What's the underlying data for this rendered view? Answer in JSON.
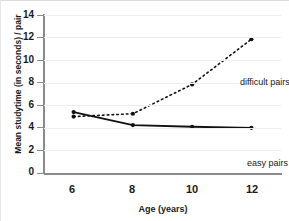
{
  "chart_data": {
    "type": "line",
    "title": "",
    "subtitle": "",
    "xlabel": "Age (years)",
    "ylabel": "Mean studytime (in seconds) / pair",
    "x": [
      6,
      8,
      10,
      12
    ],
    "xtick_labels": [
      "6",
      "8",
      "10",
      "12"
    ],
    "ytick_labels": [
      "0",
      "2",
      "4",
      "6",
      "8",
      "10",
      "12",
      "14"
    ],
    "yticks": [
      0,
      2,
      4,
      6,
      8,
      10,
      12,
      14
    ],
    "xlim": [
      5,
      13
    ],
    "ylim": [
      0,
      14
    ],
    "grid": "horizontal",
    "legend_position": "inline-annotation",
    "series": [
      {
        "name": "difficult pairs",
        "values": [
          5.0,
          5.25,
          7.85,
          11.85
        ],
        "linestyle": "dotted",
        "marker": "circle",
        "color": "#111111"
      },
      {
        "name": "easy pairs",
        "values": [
          5.4,
          4.25,
          4.1,
          4.0
        ],
        "linestyle": "solid",
        "marker": "circle",
        "color": "#111111"
      }
    ],
    "annotations": [
      {
        "text": "difficult pairs",
        "series": "difficult pairs"
      },
      {
        "text": "easy pairs",
        "series": "easy pairs"
      }
    ]
  },
  "axes": {
    "y_title": "Mean studytime (in seconds) / pair",
    "x_title": "Age (years)",
    "y_labels": [
      "14",
      "12",
      "10",
      "8",
      "6",
      "4",
      "2",
      "0"
    ],
    "x_labels": [
      "6",
      "8",
      "10",
      "12"
    ]
  },
  "labels": {
    "difficult": "difficult pairs",
    "easy": "easy pairs"
  },
  "colors": {
    "line": "#111111",
    "axis": "#8a8a8a",
    "grid": "#eceff1",
    "text": "#1a1a1a",
    "background": "#ffffff"
  }
}
